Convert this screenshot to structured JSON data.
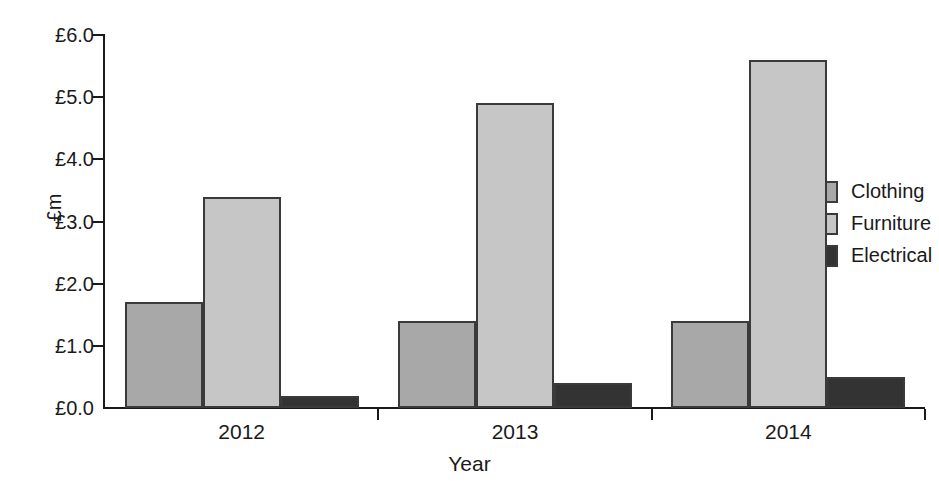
{
  "chart_data": {
    "type": "bar",
    "title": "",
    "xlabel": "Year",
    "ylabel": "£m",
    "categories": [
      "2012",
      "2013",
      "2014"
    ],
    "series": [
      {
        "name": "Clothing",
        "values": [
          1.7,
          1.4,
          1.4
        ],
        "color": "#a8a8a8"
      },
      {
        "name": "Furniture",
        "values": [
          3.4,
          4.9,
          5.6
        ],
        "color": "#c6c6c6"
      },
      {
        "name": "Electrical",
        "values": [
          0.2,
          0.4,
          0.5
        ],
        "color": "#333333"
      }
    ],
    "ylim": [
      0.0,
      6.0
    ],
    "ytick_values": [
      0.0,
      1.0,
      2.0,
      3.0,
      4.0,
      5.0,
      6.0
    ],
    "ytick_labels": [
      "£0.0",
      "£1.0",
      "£2.0",
      "£3.0",
      "£4.0",
      "£5.0",
      "£6.0"
    ],
    "grid": false,
    "legend_position": "right",
    "bar_outline_color": "#3a3a3a",
    "axis_color": "#1a1a1a",
    "background": "#ffffff"
  }
}
